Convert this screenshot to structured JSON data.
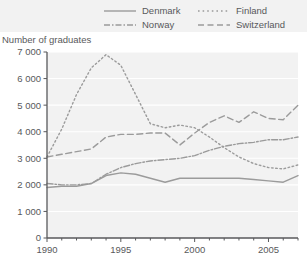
{
  "legend": {
    "items": [
      {
        "label": "Denmark",
        "style": "solid",
        "key": "denmark"
      },
      {
        "label": "Norway",
        "style": "dashdot",
        "key": "norway"
      },
      {
        "label": "Finland",
        "style": "dotted",
        "key": "finland"
      },
      {
        "label": "Switzerland",
        "style": "dashed",
        "key": "switzerland"
      }
    ],
    "background": "#f2f2f2"
  },
  "axis_title": "Number of graduates",
  "colors": {
    "line": "#9b9b9b",
    "axis": "#58595b",
    "grid": "#ffffff",
    "plot_background": "#f2f2f2",
    "legend_background": "#f2f2f2",
    "text": "#58595b"
  },
  "chart_data": {
    "type": "line",
    "title": "",
    "subtitle": "",
    "xlabel": "",
    "ylabel": "Number of graduates",
    "xlim": [
      1990,
      2007
    ],
    "ylim": [
      0,
      7000
    ],
    "ytick_labels": [
      "0",
      "1 000",
      "2 000",
      "3 000",
      "4 000",
      "5 000",
      "6 000",
      "7 000"
    ],
    "ytick_values": [
      0,
      1000,
      2000,
      3000,
      4000,
      5000,
      6000,
      7000
    ],
    "xtick_labels": [
      "1990",
      "1995",
      "2000",
      "2005"
    ],
    "xtick_values": [
      1990,
      1995,
      2000,
      2005
    ],
    "x_minor_ticks": [
      1990,
      1991,
      1992,
      1993,
      1994,
      1995,
      1996,
      1997,
      1998,
      1999,
      2000,
      2001,
      2002,
      2003,
      2004,
      2005,
      2006,
      2007
    ],
    "grid": "horizontal",
    "legend_position": "top",
    "x": [
      1990,
      1991,
      1992,
      1993,
      1994,
      1995,
      1996,
      1997,
      1998,
      1999,
      2000,
      2001,
      2002,
      2003,
      2004,
      2005,
      2006,
      2007
    ],
    "series": [
      {
        "name": "Denmark",
        "dash": "solid",
        "values": [
          1900,
          1950,
          1950,
          2050,
          2350,
          2450,
          2400,
          2250,
          2100,
          2250,
          2250,
          2250,
          2250,
          2250,
          2200,
          2150,
          2100,
          2350
        ]
      },
      {
        "name": "Norway",
        "dash": "dashdot",
        "values": [
          2050,
          2000,
          2000,
          2050,
          2400,
          2650,
          2800,
          2900,
          2950,
          3000,
          3100,
          3300,
          3450,
          3550,
          3600,
          3700,
          3700,
          3800
        ]
      },
      {
        "name": "Finland",
        "dash": "dotted",
        "values": [
          3050,
          4100,
          5400,
          6400,
          6900,
          6500,
          5400,
          4300,
          4150,
          4250,
          4150,
          3800,
          3400,
          3050,
          2800,
          2650,
          2600,
          2750
        ]
      },
      {
        "name": "Switzerland",
        "dash": "dashed",
        "values": [
          3050,
          3150,
          3250,
          3350,
          3800,
          3900,
          3900,
          3950,
          3950,
          3500,
          3950,
          4350,
          4600,
          4350,
          4750,
          4500,
          4450,
          5000
        ]
      }
    ]
  },
  "geometry": {
    "plot_left": 47,
    "plot_right": 298,
    "plot_top": 8,
    "plot_bottom": 194
  }
}
